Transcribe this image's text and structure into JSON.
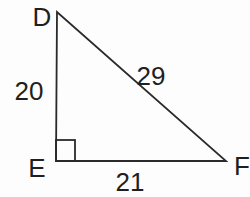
{
  "figure": {
    "type": "right-triangle",
    "vertices": [
      {
        "id": "top",
        "label": "D"
      },
      {
        "id": "bottom-left",
        "label": "E"
      },
      {
        "id": "bottom-right",
        "label": "F"
      }
    ],
    "sides": [
      {
        "name": "DE",
        "position": "left-leg",
        "length": "20"
      },
      {
        "name": "DF",
        "position": "hypotenuse",
        "length": "29"
      },
      {
        "name": "EF",
        "position": "bottom-leg",
        "length": "21"
      }
    ],
    "right_angle_at": "E",
    "colors": {
      "line": "#2a2a2a",
      "text": "#1f1f1f",
      "background": "#fdfdfd"
    }
  }
}
